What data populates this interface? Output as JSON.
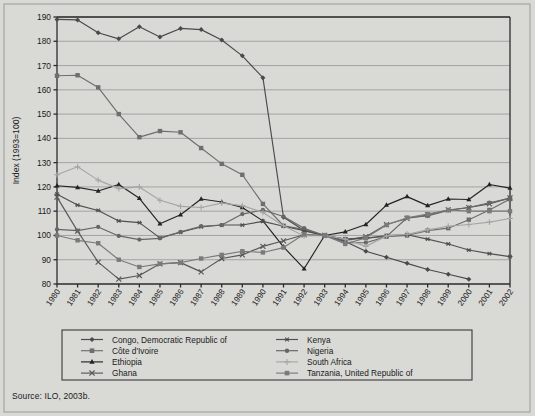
{
  "figure": {
    "background_color": "#d9d9d6",
    "source_note": "Source: ILO, 2003b."
  },
  "axes": {
    "ylabel": "Index (1993=100)",
    "xlabel": "",
    "ylim": [
      80,
      190
    ],
    "yticks": [
      80,
      90,
      100,
      110,
      120,
      130,
      140,
      150,
      160,
      170,
      180,
      190
    ],
    "grid": "horizontal"
  },
  "legend": {
    "position": "below-axes",
    "columns": 2,
    "entries": [
      {
        "label": "Congo, Democratic Republic of",
        "marker": "diamond",
        "color": "#4a4a4a"
      },
      {
        "label": "Côte d'Ivoire",
        "marker": "square",
        "color": "#6e6e6e"
      },
      {
        "label": "Ethiopia",
        "marker": "triangle",
        "color": "#232323"
      },
      {
        "label": "Ghana",
        "marker": "x",
        "color": "#585858"
      },
      {
        "label": "Kenya",
        "marker": "star",
        "color": "#505050"
      },
      {
        "label": "Nigeria",
        "marker": "circle",
        "color": "#666666"
      },
      {
        "label": "South Africa",
        "marker": "plus",
        "color": "#a6a6a6"
      },
      {
        "label": "Tanzania, United Republic of",
        "marker": "square-filled",
        "color": "#7a7a7a"
      }
    ]
  },
  "chart_data": {
    "type": "line",
    "title": "",
    "xlabel": "",
    "ylabel": "Index (1993=100)",
    "ylim": [
      80,
      190
    ],
    "xlim": [
      "1980",
      "2002"
    ],
    "grid": true,
    "legend_position": "below",
    "categories": [
      "1980",
      "1981",
      "1982",
      "1983",
      "1984",
      "1985",
      "1986",
      "1987",
      "1988",
      "1989",
      "1990",
      "1991",
      "1992",
      "1993",
      "1994",
      "1995",
      "1996",
      "1997",
      "1998",
      "1999",
      "2000",
      "2001",
      "2002"
    ],
    "series": [
      {
        "name": "Congo, Democratic Republic of",
        "marker": "diamond",
        "color": "#4a4a4a",
        "values": [
          189.0,
          188.8,
          183.5,
          181.0,
          186.0,
          181.8,
          185.3,
          184.8,
          180.5,
          174.0,
          165.0,
          107.5,
          102.0,
          100.0,
          97.5,
          93.5,
          91.0,
          88.5,
          86.0,
          84.0,
          82.0,
          null,
          null
        ]
      },
      {
        "name": "Côte d'Ivoire",
        "marker": "square",
        "color": "#6e6e6e",
        "values": [
          165.8,
          166.0,
          161.0,
          150.0,
          140.5,
          143.0,
          142.5,
          136.0,
          129.5,
          125.0,
          113.0,
          104.0,
          102.5,
          100.0,
          98.5,
          99.0,
          99.5,
          100.0,
          102.0,
          103.0,
          106.5,
          110.5,
          115.0
        ]
      },
      {
        "name": "Ethiopia",
        "marker": "triangle",
        "color": "#232323",
        "values": [
          120.5,
          119.8,
          118.3,
          121.0,
          115.3,
          104.8,
          108.5,
          115.0,
          113.8,
          111.5,
          106.0,
          95.3,
          86.3,
          100.0,
          101.5,
          104.5,
          112.5,
          116.0,
          112.3,
          115.0,
          114.8,
          121.0,
          119.5
        ]
      },
      {
        "name": "Ghana",
        "marker": "x",
        "color": "#585858",
        "values": [
          115.8,
          101.8,
          89.0,
          82.0,
          83.5,
          88.3,
          88.8,
          85.0,
          90.5,
          92.0,
          95.5,
          97.8,
          100.3,
          100.0,
          98.0,
          99.5,
          104.5,
          107.0,
          108.5,
          110.5,
          111.5,
          113.0,
          115.5
        ]
      },
      {
        "name": "Kenya",
        "marker": "star",
        "color": "#505050",
        "values": [
          117.0,
          112.5,
          110.3,
          106.0,
          105.3,
          99.0,
          101.3,
          103.5,
          104.3,
          104.3,
          105.8,
          103.8,
          102.0,
          100.0,
          98.5,
          98.8,
          100.0,
          100.3,
          98.5,
          96.5,
          94.0,
          92.5,
          91.3
        ]
      },
      {
        "name": "Nigeria",
        "marker": "circle",
        "color": "#666666",
        "values": [
          102.5,
          102.0,
          103.5,
          99.8,
          98.3,
          98.8,
          101.5,
          103.8,
          104.3,
          108.8,
          110.5,
          107.8,
          103.0,
          100.0,
          97.0,
          97.0,
          99.5,
          107.3,
          108.0,
          110.3,
          111.5,
          113.5,
          115.3
        ]
      },
      {
        "name": "South Africa",
        "marker": "plus",
        "color": "#a6a6a6",
        "values": [
          125.0,
          128.3,
          122.8,
          119.3,
          120.0,
          114.5,
          112.0,
          111.5,
          113.3,
          112.3,
          109.5,
          104.0,
          99.8,
          100.0,
          98.5,
          95.5,
          99.8,
          100.5,
          102.3,
          103.8,
          104.5,
          105.5,
          107.0
        ]
      },
      {
        "name": "Tanzania, United Republic of",
        "marker": "square-filled",
        "color": "#7a7a7a",
        "values": [
          100.0,
          98.0,
          96.8,
          90.0,
          87.0,
          88.3,
          88.8,
          90.5,
          92.0,
          93.5,
          93.0,
          95.0,
          100.5,
          100.0,
          96.5,
          99.0,
          104.3,
          107.3,
          108.8,
          110.5,
          110.0,
          110.0,
          110.0
        ]
      }
    ]
  }
}
